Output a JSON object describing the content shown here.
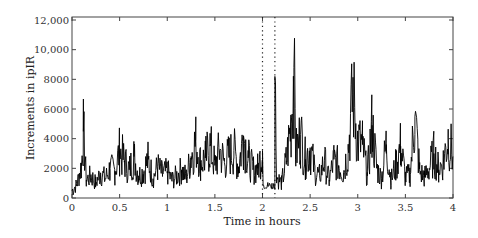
{
  "chart_data": {
    "type": "line",
    "title": "",
    "xlabel": "Time in hours",
    "ylabel": "Increments in ipIR",
    "xlim": [
      0,
      4
    ],
    "ylim": [
      0,
      12000
    ],
    "xticks": [
      "0",
      "0.5",
      "1",
      "1.5",
      "2",
      "2.5",
      "3",
      "3.5",
      "4"
    ],
    "yticks": [
      "0",
      "2000",
      "4000",
      "6000",
      "8000",
      "10,000",
      "12,000"
    ],
    "grid": false,
    "legend": null,
    "annotations": [
      {
        "type": "vertical-dotted-line",
        "x": 2.0
      },
      {
        "type": "vertical-dotted-line",
        "x": 2.13
      }
    ],
    "series": [
      {
        "name": "ipIR increments",
        "color": "#000000",
        "x": [
          0,
          0.05,
          0.1,
          0.12,
          0.15,
          0.2,
          0.25,
          0.3,
          0.35,
          0.4,
          0.45,
          0.5,
          0.55,
          0.6,
          0.65,
          0.7,
          0.75,
          0.8,
          0.85,
          0.9,
          0.95,
          1.0,
          1.05,
          1.1,
          1.15,
          1.2,
          1.25,
          1.3,
          1.35,
          1.4,
          1.45,
          1.5,
          1.55,
          1.6,
          1.65,
          1.7,
          1.75,
          1.8,
          1.85,
          1.9,
          1.95,
          2.0,
          2.05,
          2.1,
          2.13,
          2.15,
          2.2,
          2.25,
          2.3,
          2.33,
          2.35,
          2.4,
          2.45,
          2.5,
          2.55,
          2.6,
          2.65,
          2.7,
          2.75,
          2.8,
          2.85,
          2.9,
          2.95,
          3.0,
          3.05,
          3.1,
          3.15,
          3.2,
          3.25,
          3.3,
          3.35,
          3.4,
          3.45,
          3.5,
          3.55,
          3.6,
          3.65,
          3.7,
          3.75,
          3.8,
          3.85,
          3.9,
          3.95,
          4.0
        ],
        "values": [
          500,
          900,
          2200,
          4500,
          1200,
          1500,
          1000,
          1700,
          1300,
          2000,
          1800,
          3200,
          2500,
          1900,
          2800,
          1500,
          1800,
          2600,
          1300,
          2100,
          1600,
          1800,
          1200,
          1500,
          1900,
          1400,
          2800,
          3800,
          2400,
          2700,
          3500,
          2200,
          3200,
          2400,
          2900,
          3200,
          2100,
          4200,
          2700,
          1900,
          2000,
          3200,
          800,
          600,
          8200,
          1400,
          1000,
          2500,
          5000,
          8800,
          3000,
          4300,
          2600,
          3400,
          1800,
          1500,
          2500,
          1200,
          2600,
          2200,
          1700,
          3300,
          7100,
          3800,
          3600,
          1500,
          4900,
          2000,
          1300,
          3600,
          1200,
          2200,
          3500,
          1400,
          1600,
          5500,
          1800,
          1400,
          2000,
          3000,
          1900,
          2500,
          4100,
          2800
        ]
      }
    ]
  }
}
